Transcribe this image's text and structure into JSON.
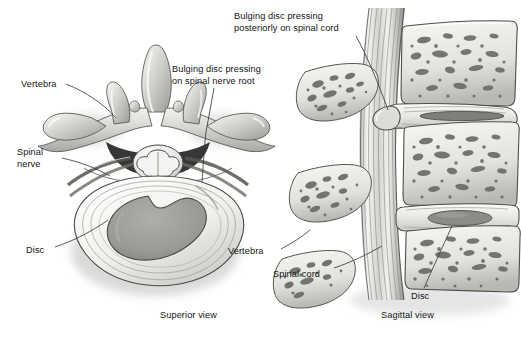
{
  "figure": {
    "background_color": "#ffffff",
    "line_color": "#3c3c3c",
    "text_color": "#131313"
  },
  "panels": [
    {
      "id": "superior",
      "caption": "Superior view",
      "caption_x": 160,
      "caption_y": 315
    },
    {
      "id": "sagittal",
      "caption": "Sagittal view",
      "caption_x": 381,
      "caption_y": 315
    }
  ],
  "labels": [
    {
      "name": "label-vertebra-superior",
      "lines": [
        "Vertebra"
      ],
      "x": 21,
      "y": 79,
      "panel": "superior"
    },
    {
      "name": "label-spinal-nerve",
      "lines": [
        "Spinal",
        "nerve"
      ],
      "x": 17,
      "y": 147,
      "panel": "superior"
    },
    {
      "name": "label-disc-superior",
      "lines": [
        "Disc"
      ],
      "x": 26,
      "y": 245,
      "panel": "superior"
    },
    {
      "name": "label-bulging-disc-nerve-root",
      "lines": [
        "Bulging disc pressing",
        "on spinal nerve root"
      ],
      "x": 172,
      "y": 64,
      "panel": "superior"
    },
    {
      "name": "label-bulging-disc-spinal-cord",
      "lines": [
        "Bulging disc pressing",
        "posteriorly on spinal cord"
      ],
      "x": 234,
      "y": 11,
      "panel": "sagittal"
    },
    {
      "name": "label-vertebra-sagittal",
      "lines": [
        "Vertebra"
      ],
      "x": 228,
      "y": 246,
      "panel": "sagittal"
    },
    {
      "name": "label-spinal-cord",
      "lines": [
        "Spinal cord"
      ],
      "x": 273,
      "y": 269,
      "panel": "sagittal"
    },
    {
      "name": "label-disc-sagittal",
      "lines": [
        "Disc"
      ],
      "x": 411,
      "y": 291,
      "panel": "sagittal"
    }
  ],
  "anatomy": {
    "superior_view": {
      "structures": [
        "spinous process",
        "transverse process",
        "superior articular process",
        "vertebral arch",
        "spinal cord with butterfly gray matter",
        "spinal nerve roots",
        "intervertebral disc annulus fibrosus",
        "nucleus pulposus"
      ],
      "nucleus_color": "#9a9a9a",
      "annulus_color": "#ededea",
      "bone_color": "#cfcfcb"
    },
    "sagittal_view": {
      "structures": [
        "vertebral bodies with trabecular bone",
        "spinous processes",
        "spinal cord fiber bundle",
        "bulging disc compressing cord",
        "normal intervertebral disc"
      ],
      "bone_color": "#e8e8e4",
      "trabecular_color": "#6f6f6f",
      "cord_color": "#d8d8d6",
      "disc_nucleus_color": "#8f8f8f"
    }
  }
}
